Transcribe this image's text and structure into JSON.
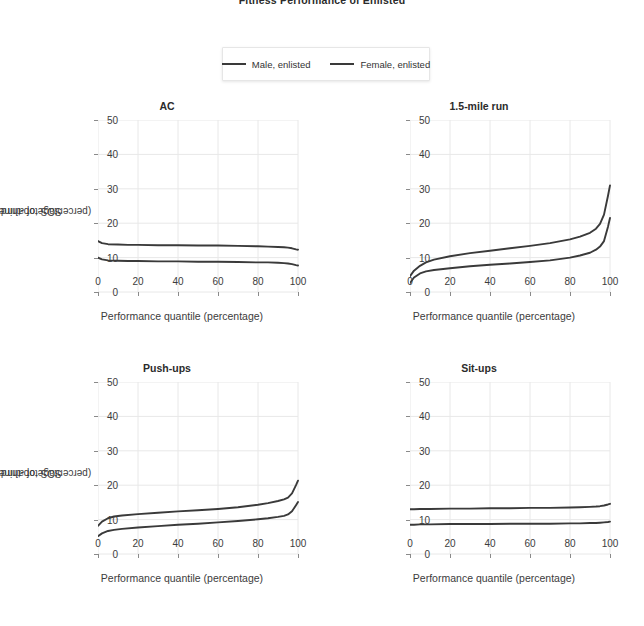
{
  "figure": {
    "title": "Fitness Performance of Enlisted",
    "background": "#ffffff",
    "text_color": "#3c3c3c"
  },
  "legend": {
    "position": "top-center",
    "entries": [
      {
        "label": "Male, enlisted",
        "color": "#3a3a3a",
        "swatch": "line-swatch-icon"
      },
      {
        "label": "Female, enlisted",
        "color": "#3a3a3a",
        "swatch": "line-swatch-icon"
      }
    ]
  },
  "axes": {
    "xlabel": "Performance quantile (percentage)",
    "ylabel_line1": "SOS top-third or DG",
    "ylabel_line2": "(percentage of airmen)",
    "xticks": [
      0,
      20,
      40,
      60,
      80,
      100
    ],
    "yticks": [
      0,
      10,
      20,
      30,
      40,
      50
    ],
    "xlim": [
      0,
      100
    ],
    "ylim": [
      0,
      50
    ],
    "grid": true,
    "grid_color": "#e8e8e8"
  },
  "chart_data": [
    {
      "type": "line",
      "title": "AC",
      "xlabel": "Performance quantile (percentage)",
      "ylabel": "SOS top-third or DG (percentage of airmen)",
      "xlim": [
        0,
        100
      ],
      "ylim": [
        0,
        50
      ],
      "xticks": [
        0,
        20,
        40,
        60,
        80,
        100
      ],
      "yticks": [
        0,
        10,
        20,
        30,
        40,
        50
      ],
      "grid": true,
      "legend_position": "figure-top-center",
      "x": [
        0,
        2,
        5,
        10,
        15,
        20,
        30,
        40,
        50,
        60,
        70,
        80,
        85,
        90,
        93,
        95,
        97,
        99,
        100
      ],
      "series": [
        {
          "name": "Male, enlisted",
          "color": "#3a3a3a",
          "values": [
            14.8,
            14.2,
            13.9,
            13.8,
            13.7,
            13.7,
            13.6,
            13.6,
            13.5,
            13.5,
            13.4,
            13.3,
            13.2,
            13.1,
            13.0,
            12.9,
            12.7,
            12.4,
            12.3
          ]
        },
        {
          "name": "Female, enlisted",
          "color": "#3a3a3a",
          "values": [
            10.0,
            9.5,
            9.2,
            9.1,
            9.0,
            9.0,
            8.9,
            8.9,
            8.8,
            8.8,
            8.7,
            8.6,
            8.6,
            8.5,
            8.4,
            8.3,
            8.1,
            7.8,
            7.7
          ]
        }
      ]
    },
    {
      "type": "line",
      "title": "1.5-mile run",
      "xlabel": "Performance quantile (percentage)",
      "ylabel": "SOS top-third or DG (percentage of airmen)",
      "xlim": [
        0,
        100
      ],
      "ylim": [
        0,
        50
      ],
      "xticks": [
        0,
        20,
        40,
        60,
        80,
        100
      ],
      "yticks": [
        0,
        10,
        20,
        30,
        40,
        50
      ],
      "grid": true,
      "legend_position": "figure-top-center",
      "x": [
        0,
        2,
        5,
        8,
        12,
        20,
        30,
        40,
        50,
        60,
        70,
        80,
        85,
        90,
        93,
        95,
        97,
        99,
        100
      ],
      "series": [
        {
          "name": "Male, enlisted",
          "color": "#3a3a3a",
          "values": [
            4.6,
            6.2,
            7.6,
            8.6,
            9.4,
            10.4,
            11.3,
            12.0,
            12.7,
            13.4,
            14.2,
            15.3,
            16.1,
            17.2,
            18.4,
            19.8,
            22.5,
            28.0,
            31.0
          ]
        },
        {
          "name": "Female, enlisted",
          "color": "#3a3a3a",
          "values": [
            2.6,
            4.2,
            5.4,
            6.0,
            6.4,
            6.9,
            7.5,
            7.9,
            8.3,
            8.7,
            9.2,
            10.0,
            10.6,
            11.4,
            12.3,
            13.2,
            14.8,
            19.0,
            21.5
          ]
        }
      ]
    },
    {
      "type": "line",
      "title": "Push-ups",
      "xlabel": "Performance quantile (percentage)",
      "ylabel": "SOS top-third or DG (percentage of airmen)",
      "xlim": [
        0,
        100
      ],
      "ylim": [
        0,
        50
      ],
      "xticks": [
        0,
        20,
        40,
        60,
        80,
        100
      ],
      "yticks": [
        0,
        10,
        20,
        30,
        40,
        50
      ],
      "grid": true,
      "legend_position": "figure-top-center",
      "x": [
        0,
        2,
        5,
        8,
        12,
        20,
        30,
        40,
        50,
        60,
        70,
        80,
        85,
        90,
        93,
        95,
        97,
        99,
        100
      ],
      "series": [
        {
          "name": "Male, enlisted",
          "color": "#3a3a3a",
          "values": [
            8.2,
            9.4,
            10.4,
            10.9,
            11.2,
            11.6,
            12.0,
            12.4,
            12.7,
            13.1,
            13.6,
            14.3,
            14.8,
            15.4,
            15.9,
            16.4,
            17.6,
            20.0,
            21.3
          ]
        },
        {
          "name": "Female, enlisted",
          "color": "#3a3a3a",
          "values": [
            5.2,
            6.0,
            6.7,
            7.0,
            7.3,
            7.7,
            8.1,
            8.5,
            8.8,
            9.2,
            9.6,
            10.1,
            10.4,
            10.8,
            11.1,
            11.5,
            12.4,
            14.2,
            15.1
          ]
        }
      ]
    },
    {
      "type": "line",
      "title": "Sit-ups",
      "xlabel": "Performance quantile (percentage)",
      "ylabel": "SOS top-third or DG (percentage of airmen)",
      "xlim": [
        0,
        100
      ],
      "ylim": [
        0,
        50
      ],
      "xticks": [
        0,
        20,
        40,
        60,
        80,
        100
      ],
      "yticks": [
        0,
        10,
        20,
        30,
        40,
        50
      ],
      "grid": true,
      "legend_position": "figure-top-center",
      "x": [
        0,
        2,
        5,
        10,
        20,
        30,
        40,
        50,
        60,
        70,
        80,
        85,
        90,
        93,
        95,
        97,
        99,
        100
      ],
      "series": [
        {
          "name": "Male, enlisted",
          "color": "#3a3a3a",
          "values": [
            13.0,
            13.0,
            13.1,
            13.1,
            13.2,
            13.2,
            13.3,
            13.3,
            13.4,
            13.4,
            13.5,
            13.6,
            13.7,
            13.8,
            13.9,
            14.1,
            14.4,
            14.6
          ]
        },
        {
          "name": "Female, enlisted",
          "color": "#3a3a3a",
          "values": [
            8.5,
            8.5,
            8.6,
            8.6,
            8.7,
            8.7,
            8.7,
            8.8,
            8.8,
            8.8,
            8.9,
            8.9,
            9.0,
            9.0,
            9.1,
            9.2,
            9.3,
            9.4
          ]
        }
      ]
    }
  ]
}
